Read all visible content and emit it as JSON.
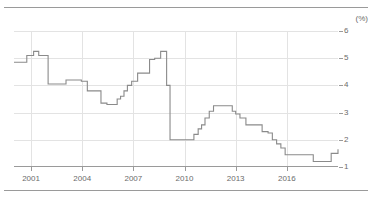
{
  "chart_data": {
    "type": "line",
    "title": "",
    "subtitle": "",
    "xlabel": "",
    "ylabel": "",
    "unit_label": "(%)",
    "grid": true,
    "legend": false,
    "legend_position": "none",
    "step_style": "post",
    "line_color": "#8a8a8a",
    "grid_color": "#e3e3e3",
    "axis_color": "#9a9a9a",
    "xlim": [
      2000.0,
      2019.0
    ],
    "ylim": [
      1,
      6
    ],
    "xticks": [
      2001,
      2004,
      2007,
      2010,
      2013,
      2016
    ],
    "xtick_labels": [
      "2001",
      "2004",
      "2007",
      "2010",
      "2013",
      "2016"
    ],
    "yticks": [
      1,
      2,
      3,
      4,
      5,
      6
    ],
    "ytick_labels": [
      "1",
      "2",
      "3",
      "4",
      "5",
      "6"
    ],
    "series": [
      {
        "name": "rate",
        "x": [
          2000.0,
          2000.55,
          2000.75,
          2000.95,
          2001.15,
          2001.45,
          2001.7,
          2002.0,
          2002.45,
          2003.05,
          2003.45,
          2003.95,
          2004.3,
          2004.6,
          2004.85,
          2005.1,
          2005.45,
          2005.85,
          2006.05,
          2006.25,
          2006.45,
          2006.65,
          2006.9,
          2007.25,
          2007.6,
          2007.95,
          2008.25,
          2008.45,
          2008.6,
          2008.75,
          2008.95,
          2009.15,
          2010.3,
          2010.55,
          2010.8,
          2011.0,
          2011.2,
          2011.45,
          2011.7,
          2011.95,
          2012.45,
          2012.8,
          2013.0,
          2013.25,
          2013.6,
          2014.2,
          2014.55,
          2014.9,
          2015.15,
          2015.4,
          2015.65,
          2015.9,
          2016.4,
          2017.2,
          2017.55,
          2018.25,
          2018.6,
          2018.85,
          2019.0
        ],
        "y": [
          4.85,
          4.85,
          5.1,
          5.1,
          5.25,
          5.1,
          5.1,
          4.05,
          4.05,
          4.2,
          4.2,
          4.15,
          3.8,
          3.8,
          3.8,
          3.35,
          3.3,
          3.3,
          3.5,
          3.6,
          3.8,
          4.0,
          4.15,
          4.45,
          4.45,
          4.95,
          5.0,
          5.0,
          5.25,
          5.25,
          4.0,
          2.0,
          2.0,
          2.2,
          2.4,
          2.55,
          2.8,
          3.05,
          3.25,
          3.25,
          3.25,
          3.05,
          2.95,
          2.8,
          2.55,
          2.55,
          2.3,
          2.25,
          2.0,
          1.85,
          1.7,
          1.45,
          1.45,
          1.45,
          1.2,
          1.2,
          1.5,
          1.5,
          1.65
        ]
      }
    ]
  }
}
